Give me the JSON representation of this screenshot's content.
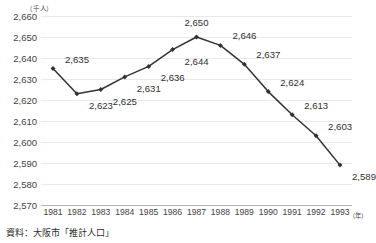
{
  "chart_data": {
    "type": "line",
    "title": "",
    "xlabel": "（年）",
    "ylabel": "（千人）",
    "ylim": [
      2570,
      2660
    ],
    "ytick_step": 10,
    "grid": true,
    "legend": "none",
    "categories": [
      "1981",
      "1982",
      "1983",
      "1984",
      "1985",
      "1986",
      "1987",
      "1988",
      "1989",
      "1990",
      "1991",
      "1992",
      "1993"
    ],
    "values": [
      2635,
      2623,
      2625,
      2631,
      2636,
      2644,
      2650,
      2646,
      2637,
      2624,
      2613,
      2603,
      2589
    ],
    "point_labels": [
      "2,635",
      "2,623",
      "2,625",
      "2,631",
      "2,636",
      "2,644",
      "2,650",
      "2,646",
      "2,637",
      "2,624",
      "2,613",
      "2,603",
      "2,589"
    ],
    "label_positions": [
      "above-right",
      "below-right",
      "below-right",
      "below-right",
      "below-right",
      "below-right",
      "above",
      "above-right",
      "above-right",
      "above-right",
      "above-right",
      "above-right",
      "below-right"
    ],
    "yticks": [
      "2,660",
      "2,650",
      "2,640",
      "2,630",
      "2,620",
      "2,610",
      "2,600",
      "2,590",
      "2,580",
      "2,570"
    ],
    "ytick_values": [
      2660,
      2650,
      2640,
      2630,
      2620,
      2610,
      2600,
      2590,
      2580,
      2570
    ],
    "series_color": "#333333",
    "grid_color": "#e9e9e9",
    "axis_color": "#b4b4b4"
  },
  "source_note": "資料：大阪市「推計人口」"
}
